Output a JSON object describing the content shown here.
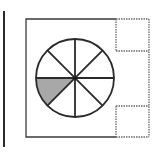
{
  "diagram": {
    "colors": {
      "stroke": "#2a2a2a",
      "shade": "#a8a8a8",
      "dashed": "#6a6a6a",
      "background": "#ffffff"
    },
    "left_bar": {
      "x": 4,
      "y1": 11,
      "y2": 147
    },
    "outer_square": {
      "x": 26,
      "y": 19,
      "width": 90,
      "height": 118
    },
    "circle": {
      "cx": 75,
      "cy": 78,
      "r": 39,
      "sectors": 8,
      "shaded_sector_index": 4
    },
    "dashed_flaps": [
      {
        "name": "top-flap",
        "x": 116,
        "y": 19,
        "width": 33,
        "height": 32
      },
      {
        "name": "bottom-flap",
        "x": 116,
        "y": 106,
        "width": 33,
        "height": 31
      }
    ],
    "dashed_right_edge": {
      "x": 149,
      "y1": 19,
      "y2": 137
    }
  }
}
